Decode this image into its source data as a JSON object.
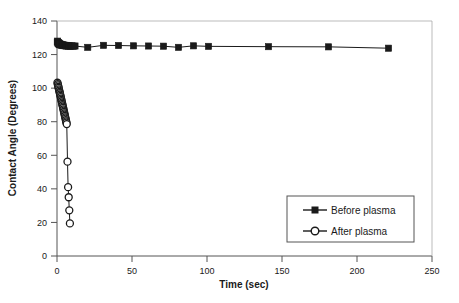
{
  "chart_data": {
    "type": "scatter",
    "title": "",
    "xlabel": "Time (sec)",
    "ylabel": "Contact Angle (Degrees)",
    "xlim": [
      0,
      250
    ],
    "ylim": [
      0,
      140
    ],
    "xticks": [
      0,
      50,
      100,
      150,
      200,
      250
    ],
    "yticks": [
      0,
      20,
      40,
      60,
      80,
      100,
      120,
      140
    ],
    "grid": false,
    "legend_position": "inside-bottom-right",
    "series": [
      {
        "name": "Before plasma",
        "marker": "filled-square",
        "color": "#1a1a1a",
        "points": [
          [
            0.2,
            127.5
          ],
          [
            0.4,
            128.0
          ],
          [
            0.6,
            126.8
          ],
          [
            0.8,
            127.2
          ],
          [
            1.0,
            126.4
          ],
          [
            1.2,
            126.9
          ],
          [
            1.4,
            126.2
          ],
          [
            1.6,
            126.6
          ],
          [
            1.8,
            125.9
          ],
          [
            2.0,
            126.3
          ],
          [
            2.3,
            125.8
          ],
          [
            2.6,
            126.1
          ],
          [
            3.0,
            125.6
          ],
          [
            3.4,
            125.9
          ],
          [
            3.8,
            125.4
          ],
          [
            4.2,
            125.7
          ],
          [
            4.6,
            125.3
          ],
          [
            5.0,
            125.6
          ],
          [
            5.5,
            125.2
          ],
          [
            6.0,
            125.5
          ],
          [
            6.5,
            125.1
          ],
          [
            7.0,
            125.4
          ],
          [
            7.5,
            125.0
          ],
          [
            8.0,
            125.3
          ],
          [
            9.0,
            125.0
          ],
          [
            10.0,
            125.2
          ],
          [
            11.0,
            125.0
          ],
          [
            12.0,
            125.1
          ],
          [
            20.5,
            124.3
          ],
          [
            31.0,
            125.5
          ],
          [
            41.0,
            125.4
          ],
          [
            51.0,
            125.2
          ],
          [
            61.0,
            125.1
          ],
          [
            71.0,
            125.0
          ],
          [
            81.0,
            124.3
          ],
          [
            91.0,
            125.2
          ],
          [
            101.0,
            124.9
          ],
          [
            141.0,
            124.7
          ],
          [
            181.0,
            124.6
          ],
          [
            221.0,
            123.8
          ]
        ]
      },
      {
        "name": "After plasma",
        "marker": "open-circle",
        "color": "#1a1a1a",
        "points": [
          [
            0.3,
            103.2
          ],
          [
            0.5,
            102.4
          ],
          [
            0.7,
            101.6
          ],
          [
            0.9,
            100.8
          ],
          [
            1.1,
            100.1
          ],
          [
            1.3,
            99.3
          ],
          [
            1.5,
            98.5
          ],
          [
            1.7,
            97.7
          ],
          [
            1.9,
            97.0
          ],
          [
            2.1,
            96.2
          ],
          [
            2.3,
            95.4
          ],
          [
            2.5,
            94.6
          ],
          [
            2.7,
            93.8
          ],
          [
            2.9,
            93.0
          ],
          [
            3.1,
            92.2
          ],
          [
            3.3,
            91.4
          ],
          [
            3.5,
            90.6
          ],
          [
            3.7,
            89.8
          ],
          [
            3.9,
            89.0
          ],
          [
            4.1,
            88.2
          ],
          [
            4.3,
            87.4
          ],
          [
            4.5,
            86.6
          ],
          [
            4.7,
            85.8
          ],
          [
            4.9,
            85.0
          ],
          [
            5.1,
            84.2
          ],
          [
            5.3,
            83.4
          ],
          [
            5.5,
            82.6
          ],
          [
            5.7,
            81.8
          ],
          [
            5.9,
            81.0
          ],
          [
            6.1,
            80.2
          ],
          [
            6.3,
            79.4
          ],
          [
            6.5,
            78.6
          ],
          [
            7.0,
            56.2
          ],
          [
            7.4,
            41.0
          ],
          [
            7.8,
            35.0
          ],
          [
            8.2,
            27.2
          ],
          [
            8.6,
            19.4
          ]
        ]
      }
    ]
  },
  "axes": {
    "x_tick_labels": [
      "0",
      "50",
      "100",
      "150",
      "200",
      "250"
    ],
    "y_tick_labels": [
      "0",
      "20",
      "40",
      "60",
      "80",
      "100",
      "120",
      "140"
    ],
    "x_title": "Time (sec)",
    "y_title": "Contact Angle (Degrees)"
  },
  "legend": {
    "items": [
      {
        "label": "Before plasma",
        "marker": "filled-square-icon"
      },
      {
        "label": "After plasma",
        "marker": "open-circle-icon"
      }
    ]
  }
}
